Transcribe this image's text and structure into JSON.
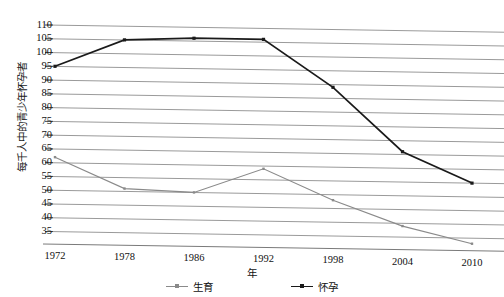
{
  "chart_data": {
    "type": "line",
    "title": "",
    "xlabel": "年",
    "ylabel": "每千人中的青少年怀孕者",
    "categories": [
      "1972",
      "1978",
      "1986",
      "1992",
      "1998",
      "2004",
      "2010"
    ],
    "series": [
      {
        "name": "生育",
        "color": "#8a8a8a",
        "values": [
          62,
          51,
          50,
          59,
          48,
          39,
          33
        ]
      },
      {
        "name": "怀孕",
        "color": "#1a1a1a",
        "values": [
          95,
          105,
          106,
          106,
          89,
          66,
          55
        ]
      }
    ],
    "ylim": [
      33,
      112
    ],
    "yticks": [
      110,
      105,
      100,
      95,
      90,
      85,
      80,
      75,
      70,
      65,
      60,
      55,
      50,
      45,
      40,
      35
    ],
    "grid": true,
    "legend_position": "bottom"
  },
  "axes": {
    "y_title": "每千人中的青少年怀孕者",
    "x_title": "年"
  },
  "legend": {
    "items": [
      {
        "label": "生育",
        "color": "#8a8a8a"
      },
      {
        "label": "怀孕",
        "color": "#1a1a1a"
      }
    ]
  },
  "faded_header": {
    "text": ""
  }
}
